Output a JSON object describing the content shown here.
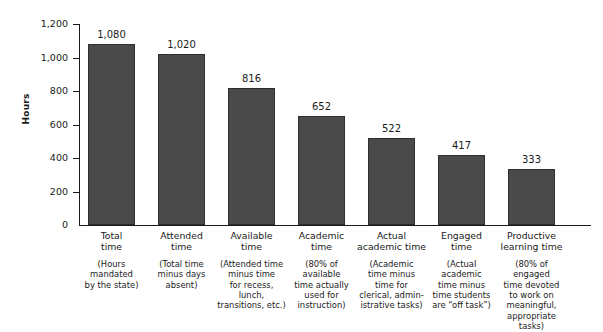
{
  "chart_data": {
    "type": "bar",
    "title": "",
    "xlabel": "",
    "ylabel": "Hours",
    "ylim": [
      0,
      1200
    ],
    "yticks": [
      0,
      200,
      400,
      600,
      800,
      1000,
      1200
    ],
    "ytick_labels": [
      "0",
      "200",
      "400",
      "600",
      "800",
      "1,000",
      "1,200"
    ],
    "grid": false,
    "legend": "none",
    "bar_color": "#4a4a4a",
    "axis_color": "#1a1a1a",
    "categories": [
      "Total\ntime",
      "Attended\ntime",
      "Available\ntime",
      "Academic\ntime",
      "Actual\nacademic time",
      "Engaged\ntime",
      "Productive\nlearning time"
    ],
    "category_descriptions": [
      "(Hours\nmandated\nby the state)",
      "(Total time\nminus days\nabsent)",
      "(Attended time\nminus time\nfor recess, lunch,\ntransitions, etc.)",
      "(80% of\navailable\ntime actually\nused for\ninstruction)",
      "(Academic\ntime minus\ntime for\nclerical, admin-\nistrative tasks)",
      "(Actual\nacademic\ntime minus\ntime students\nare “off task”)",
      "(80% of engaged\ntime devoted\nto work on\nmeaningful,\nappropriate tasks)"
    ],
    "values": [
      1080,
      1020,
      816,
      652,
      522,
      417,
      333
    ],
    "value_labels": [
      "1,080",
      "1,020",
      "816",
      "652",
      "522",
      "417",
      "333"
    ]
  }
}
